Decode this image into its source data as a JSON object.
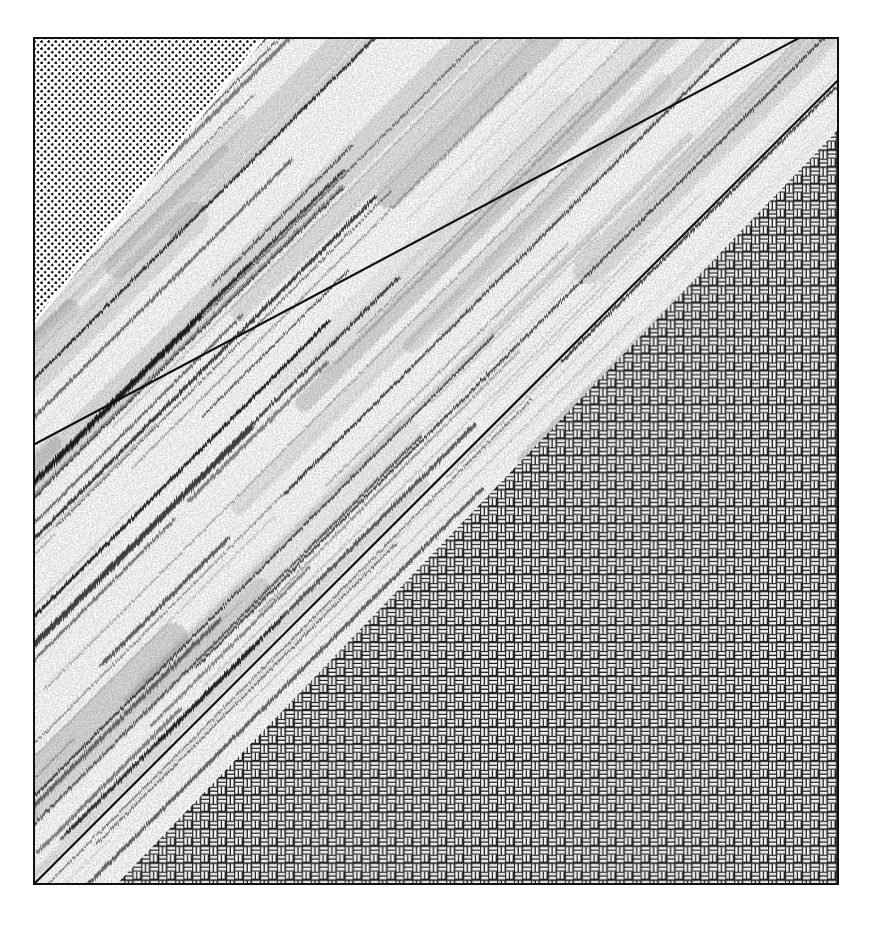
{
  "figure": {
    "domain": "Diagram",
    "caption": "",
    "canvas": {
      "width": 875,
      "height": 927,
      "background": "#ffffff"
    },
    "plate": {
      "x": 33,
      "y": 37,
      "width": 806,
      "height": 848,
      "border_color": "#111111",
      "border_width_px": 2.5,
      "fill": "#ffffff"
    }
  },
  "palette": {
    "ink": "#111111",
    "paper": "#ffffff",
    "stipple_dot": "#0d0d0d",
    "weave_line": "#1a1a1a",
    "weave_fill": "#f2f2f2",
    "pencil_dark": "#141414",
    "pencil_mid": "#555555",
    "pencil_light": "#9a9a9a"
  },
  "zones": [
    {
      "id": "stipple",
      "name": "upper-left-stipple-zone",
      "label": "Stippled ornament",
      "position": "upper-left triangle",
      "pattern": "regular square-offset dot stipple",
      "dot_spacing_px": 7.1,
      "dot_radius_px": 1.2,
      "dot_color": "#0d0d0d",
      "fill": "#ffffff"
    },
    {
      "id": "band",
      "name": "diagonal-shear-band-zone",
      "label": "Hand-drawn streaked band",
      "position": "central diagonal band",
      "pattern": "dense parallel pencil / charcoal strokes",
      "stroke_angle_deg": 45,
      "stroke_count": 430,
      "perpendicular_width_px": 300,
      "fill": "#ffffff"
    },
    {
      "id": "weave",
      "name": "lower-right-basketweave-zone",
      "label": "Basketweave ornament",
      "position": "lower-right triangle",
      "pattern": "two-brick basketweave / parquet",
      "cell_px": 14.2,
      "brick_long_px": 14.2,
      "brick_short_px": 7.1,
      "line_color": "#1a1a1a",
      "fill": "#ffffff"
    }
  ],
  "boundaries": [
    {
      "id": "upper-contact",
      "name": "upper-contact-line",
      "label": "Upper contact",
      "from": {
        "x_pct": 0,
        "y_pct": 48.0
      },
      "to": {
        "x_pct": 100,
        "y_pct": -2.5
      },
      "angle_deg": 45,
      "stroke": "#111111",
      "stroke_width_px": 2.2
    },
    {
      "id": "lower-contact",
      "name": "lower-contact-line",
      "label": "Lower contact",
      "from": {
        "x_pct": 0,
        "y_pct": 100
      },
      "to": {
        "x_pct": 100,
        "y_pct": 5.0
      },
      "angle_deg": 45,
      "stroke": "#111111",
      "stroke_width_px": 2.2
    }
  ],
  "measurements": {
    "band_top_edge_on_top_border_x_px": 412,
    "band_right_edge_on_right_border_y_px": 85,
    "band_left_edge_on_left_border_top_y_px": 425,
    "band_left_edge_on_left_border_bottom_y_px": 855,
    "weave_corner_on_bottom_border_x_px": 70
  }
}
